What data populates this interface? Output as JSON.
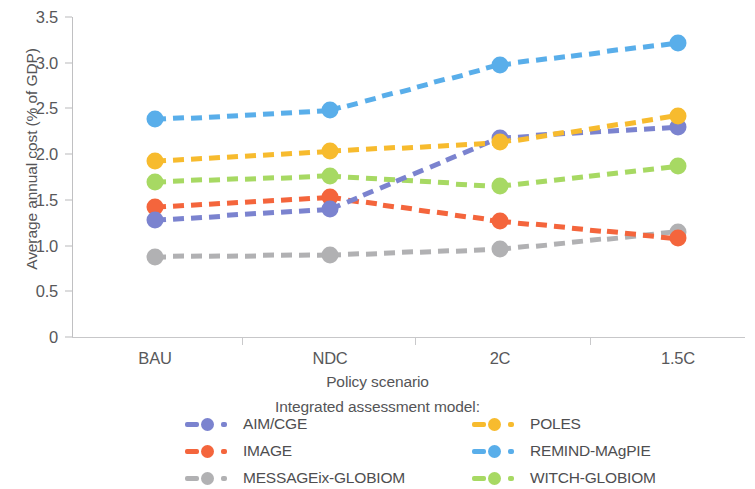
{
  "chart_data": {
    "type": "line",
    "title": "",
    "xlabel": "Policy scenario",
    "ylabel": "Average annual cost (% of GDP)",
    "categories": [
      "BAU",
      "NDC",
      "2C",
      "1.5C"
    ],
    "ytick_labels": [
      "0",
      "0.5",
      "1.0",
      "1.5",
      "2.0",
      "2.5",
      "3.0",
      "3.5"
    ],
    "ytick_values": [
      0,
      0.5,
      1.0,
      1.5,
      2.0,
      2.5,
      3.0,
      3.5
    ],
    "ylim": [
      0,
      3.5
    ],
    "grid": false,
    "legend_position": "bottom",
    "legend_title": "Integrated assessment model:",
    "marker": "circle",
    "linestyle": "dashed",
    "series": [
      {
        "name": "AIM/CGE",
        "color": "#7b83cf",
        "values": [
          1.28,
          1.4,
          2.18,
          2.3
        ]
      },
      {
        "name": "IMAGE",
        "color": "#f4653c",
        "values": [
          1.42,
          1.53,
          1.27,
          1.08
        ]
      },
      {
        "name": "MESSAGEix-GLOBIOM",
        "color": "#b1b1b3",
        "values": [
          0.88,
          0.9,
          0.96,
          1.15
        ]
      },
      {
        "name": "POLES",
        "color": "#f7bb2e",
        "values": [
          1.92,
          2.03,
          2.13,
          2.42
        ]
      },
      {
        "name": "REMIND-MAgPIE",
        "color": "#59aeea",
        "values": [
          2.38,
          2.48,
          2.98,
          3.22
        ]
      },
      {
        "name": "WITCH-GLOBIOM",
        "color": "#a7d963",
        "values": [
          1.7,
          1.76,
          1.65,
          1.87
        ]
      }
    ]
  },
  "legend": {
    "title": "Integrated assessment model:",
    "entries": [
      {
        "label": "AIM/CGE",
        "color": "#7b83cf"
      },
      {
        "label": "POLES",
        "color": "#f7bb2e"
      },
      {
        "label": "IMAGE",
        "color": "#f4653c"
      },
      {
        "label": "REMIND-MAgPIE",
        "color": "#59aeea"
      },
      {
        "label": "MESSAGEix-GLOBIOM",
        "color": "#b1b1b3"
      },
      {
        "label": "WITCH-GLOBIOM",
        "color": "#a7d963"
      }
    ]
  }
}
